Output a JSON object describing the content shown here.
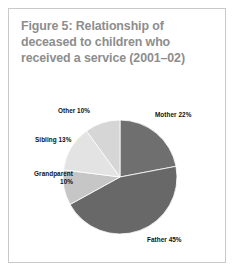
{
  "figure": {
    "title_lines": [
      "Figure 5: Relationship of",
      "deceased to children who",
      "received a service (2001–02)"
    ],
    "title_color": "#8d8d8d",
    "border_color": "#c9c9c9",
    "background": "#ffffff"
  },
  "chart_data": {
    "type": "pie",
    "title": "Figure 5: Relationship of deceased to children who received a service (2001–02)",
    "categories": [
      "Mother",
      "Father",
      "Grandparent",
      "Sibling",
      "Other"
    ],
    "values": [
      22,
      45,
      10,
      13,
      10
    ],
    "unit": "%",
    "labels": [
      "Mother 22%",
      "Father 45%",
      "Grandparent 10%",
      "Sibling 13%",
      "Other 10%"
    ],
    "colors": [
      "#6f6f6f",
      "#686868",
      "#c6c6c6",
      "#e3e3e3",
      "#d6d6d6"
    ],
    "start_angle_deg": 0,
    "direction": "clockwise",
    "legend": "none",
    "grid": false,
    "label_placement": "outside"
  },
  "labels": {
    "mother": "Mother 22%",
    "father": "Father 45%",
    "other": "Other 10%",
    "sibling": "Sibling 13%",
    "grandparent_name": "Grandparent",
    "grandparent_value": "10%"
  }
}
